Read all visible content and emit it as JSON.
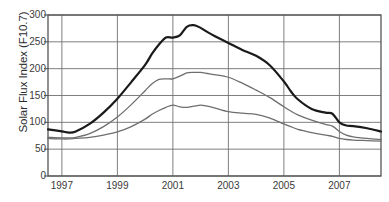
{
  "chart_data": {
    "type": "line",
    "title": "",
    "xlabel": "",
    "ylabel": "Solar Flux Index (F10.7)",
    "xlim": [
      1996.5,
      2008.5
    ],
    "ylim": [
      0,
      300
    ],
    "grid": true,
    "legend": "none",
    "y_ticks": [
      0,
      50,
      100,
      150,
      200,
      250,
      300
    ],
    "x_ticks": [
      1997,
      1999,
      2001,
      2003,
      2005,
      2007
    ],
    "x_tick_labels": [
      "1997",
      "1999",
      "2001",
      "2003",
      "2005",
      "2007"
    ],
    "y_tick_labels": [
      "0",
      "50",
      "100",
      "150",
      "200",
      "250",
      "300"
    ],
    "x": [
      1996.5,
      1997.0,
      1997.25,
      1997.5,
      1998.0,
      1998.5,
      1999.0,
      1999.5,
      2000.0,
      2000.25,
      2000.5,
      2000.75,
      2001.0,
      2001.25,
      2001.5,
      2001.75,
      2002.0,
      2002.25,
      2002.5,
      2003.0,
      2003.5,
      2004.0,
      2004.5,
      2005.0,
      2005.25,
      2005.5,
      2006.0,
      2006.5,
      2006.75,
      2007.0,
      2007.25,
      2007.5,
      2008.0,
      2008.5
    ],
    "series": [
      {
        "name": "upper-bound",
        "color": "#1a1a1a",
        "width": 2.2,
        "values": [
          87,
          83,
          81,
          83,
          97,
          118,
          144,
          175,
          207,
          228,
          245,
          258,
          258,
          262,
          278,
          281,
          276,
          268,
          261,
          248,
          235,
          224,
          206,
          176,
          158,
          143,
          125,
          118,
          116,
          100,
          94,
          93,
          89,
          83
        ]
      },
      {
        "name": "mid-estimate",
        "color": "#6e6e6e",
        "width": 1.3,
        "values": [
          72,
          71,
          71,
          72,
          79,
          92,
          110,
          133,
          159,
          172,
          180,
          181,
          181,
          186,
          192,
          193,
          193,
          191,
          189,
          184,
          173,
          160,
          146,
          129,
          121,
          114,
          104,
          96,
          93,
          83,
          76,
          73,
          70,
          68
        ]
      },
      {
        "name": "lower-bound",
        "color": "#6e6e6e",
        "width": 1.3,
        "values": [
          70,
          69,
          69,
          70,
          72,
          76,
          82,
          92,
          106,
          115,
          122,
          128,
          132,
          129,
          128,
          130,
          132,
          130,
          127,
          120,
          117,
          115,
          108,
          97,
          92,
          87,
          81,
          76,
          74,
          70,
          68,
          67,
          66,
          65
        ]
      }
    ]
  },
  "plot_geometry": {
    "left": 48,
    "right": 381,
    "top": 15,
    "bottom": 176
  },
  "colors": {
    "axis": "#555555",
    "grid": "#707070",
    "text": "#3a3a3a",
    "background": "#ffffff"
  }
}
